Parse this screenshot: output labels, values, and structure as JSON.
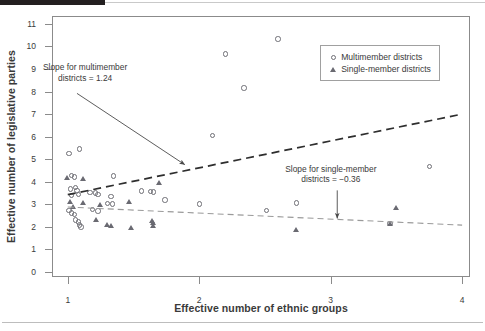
{
  "chart_data": {
    "type": "scatter",
    "title": "",
    "xlabel": "Effective number of ethnic groups",
    "ylabel": "Effective number of legislative parties",
    "xlim": [
      0.88,
      4.06
    ],
    "ylim": [
      -0.22,
      11.35
    ],
    "xticks": [
      "1",
      "2",
      "3",
      "4"
    ],
    "xtick_values": [
      1,
      2,
      3,
      4
    ],
    "yticks": [
      "0",
      "1",
      "2",
      "3",
      "4",
      "5",
      "6",
      "7",
      "8",
      "9",
      "10",
      "11"
    ],
    "ytick_values": [
      0,
      1,
      2,
      3,
      4,
      5,
      6,
      7,
      8,
      9,
      10,
      11
    ],
    "grid": false,
    "legend_position": "top-right",
    "series": [
      {
        "name": "Multimember districts",
        "marker": "open-circle",
        "color": "#6e6e75",
        "points": [
          [
            1.01,
            5.26
          ],
          [
            1.09,
            5.45
          ],
          [
            1.03,
            4.28
          ],
          [
            1.05,
            4.22
          ],
          [
            1.02,
            3.69
          ],
          [
            1.06,
            3.76
          ],
          [
            1.07,
            3.62
          ],
          [
            1.03,
            3.4
          ],
          [
            1.08,
            3.44
          ],
          [
            1.01,
            2.72
          ],
          [
            1.03,
            2.62
          ],
          [
            1.05,
            2.55
          ],
          [
            1.06,
            2.3
          ],
          [
            1.08,
            2.22
          ],
          [
            1.09,
            2.08
          ],
          [
            1.1,
            1.99
          ],
          [
            1.17,
            3.52
          ],
          [
            1.21,
            3.5
          ],
          [
            1.23,
            3.45
          ],
          [
            1.19,
            2.76
          ],
          [
            1.23,
            2.7
          ],
          [
            1.35,
            4.25
          ],
          [
            1.33,
            3.36
          ],
          [
            1.3,
            3.05
          ],
          [
            1.34,
            3.02
          ],
          [
            1.56,
            3.6
          ],
          [
            1.63,
            3.58
          ],
          [
            1.65,
            3.55
          ],
          [
            1.74,
            3.19
          ],
          [
            2.0,
            3.01
          ],
          [
            2.1,
            6.05
          ],
          [
            2.2,
            9.66
          ],
          [
            2.34,
            8.15
          ],
          [
            2.6,
            10.33
          ],
          [
            2.51,
            2.72
          ],
          [
            2.74,
            3.06
          ],
          [
            3.45,
            2.15
          ],
          [
            3.75,
            4.67
          ]
        ]
      },
      {
        "name": "Single-member districts",
        "marker": "filled-triangle",
        "color": "#6a6a72",
        "points": [
          [
            1.0,
            4.18
          ],
          [
            1.02,
            3.1
          ],
          [
            1.04,
            2.86
          ],
          [
            1.12,
            4.1
          ],
          [
            1.12,
            3.07
          ],
          [
            1.22,
            2.3
          ],
          [
            1.25,
            2.98
          ],
          [
            1.3,
            2.08
          ],
          [
            1.33,
            2.05
          ],
          [
            1.47,
            3.12
          ],
          [
            1.48,
            1.96
          ],
          [
            1.64,
            2.28
          ],
          [
            1.65,
            2.16
          ],
          [
            1.65,
            2.02
          ],
          [
            1.7,
            3.95
          ],
          [
            2.74,
            1.86
          ],
          [
            3.45,
            2.14
          ],
          [
            3.5,
            2.85
          ]
        ]
      }
    ],
    "trendlines": [
      {
        "name": "Multimember districts trend",
        "style": "dashed-dark",
        "slope": 1.24,
        "x0": 1.0,
        "y0": 3.43,
        "x1": 4.0,
        "y1": 7.0
      },
      {
        "name": "Single-member districts trend",
        "style": "dashed-light",
        "slope": -0.36,
        "x0": 1.0,
        "y0": 2.88,
        "x1": 4.0,
        "y1": 2.08
      }
    ],
    "annotations": [
      {
        "id": "multimember-slope",
        "line1": "Slope for multimember",
        "line2": "districts = 1.24",
        "arrow_from": [
          1.07,
          7.92
        ],
        "arrow_to": [
          1.89,
          4.76
        ]
      },
      {
        "id": "single-member-slope",
        "line1": "Slope for single-member",
        "line2": "districts = −0.36",
        "arrow_from": [
          3.05,
          3.62
        ],
        "arrow_to": [
          3.05,
          2.38
        ]
      }
    ],
    "legend": {
      "entries": [
        {
          "label": "Multimember districts",
          "marker": "open-circle"
        },
        {
          "label": "Single-member districts",
          "marker": "filled-triangle"
        }
      ]
    }
  }
}
